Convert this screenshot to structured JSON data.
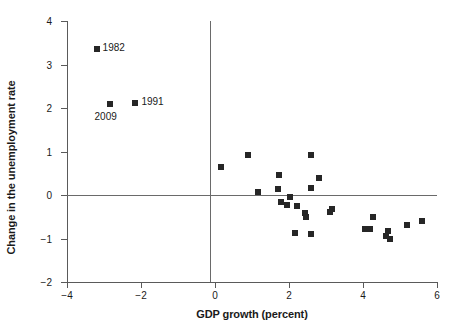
{
  "chart_data": {
    "type": "scatter",
    "title": "",
    "xlabel": "GDP growth (percent)",
    "ylabel": "Change in the unemployment rate",
    "xlim": [
      -4,
      6
    ],
    "ylim": [
      -2,
      4
    ],
    "xticks": [
      -4,
      -2,
      0,
      2,
      4,
      6
    ],
    "yticks": [
      -2,
      -1,
      0,
      1,
      2,
      3,
      4
    ],
    "xticklabels": [
      "−4",
      "−2",
      "0",
      "2",
      "4",
      "6"
    ],
    "yticklabels": [
      "−2",
      "−1",
      "0",
      "1",
      "2",
      "3",
      "4"
    ],
    "grid": false,
    "legend": "none",
    "zero_lines": {
      "horizontal": 0,
      "vertical": 0
    },
    "marker": {
      "shape": "square",
      "color": "#262626",
      "size_px": 6
    },
    "points": [
      {
        "x": -3.2,
        "y": 3.35,
        "label": "1982",
        "label_position": "right"
      },
      {
        "x": -2.85,
        "y": 2.1,
        "label": "2009",
        "label_position": "below"
      },
      {
        "x": -2.15,
        "y": 2.12,
        "label": "1991",
        "label_position": "right"
      },
      {
        "x": 0.15,
        "y": 0.65,
        "label": ""
      },
      {
        "x": 0.9,
        "y": 0.92,
        "label": ""
      },
      {
        "x": 1.15,
        "y": 0.07,
        "label": ""
      },
      {
        "x": 1.72,
        "y": 0.45,
        "label": ""
      },
      {
        "x": 1.7,
        "y": 0.14,
        "label": ""
      },
      {
        "x": 1.78,
        "y": -0.17,
        "label": ""
      },
      {
        "x": 1.95,
        "y": -0.22,
        "label": ""
      },
      {
        "x": 2.02,
        "y": -0.05,
        "label": ""
      },
      {
        "x": 2.15,
        "y": -0.88,
        "label": ""
      },
      {
        "x": 2.22,
        "y": -0.25,
        "label": ""
      },
      {
        "x": 2.42,
        "y": -0.42,
        "label": ""
      },
      {
        "x": 2.45,
        "y": -0.5,
        "label": ""
      },
      {
        "x": 2.6,
        "y": 0.92,
        "label": ""
      },
      {
        "x": 2.6,
        "y": 0.17,
        "label": ""
      },
      {
        "x": 2.6,
        "y": -0.9,
        "label": ""
      },
      {
        "x": 2.82,
        "y": 0.4,
        "label": ""
      },
      {
        "x": 3.1,
        "y": -0.38,
        "label": ""
      },
      {
        "x": 3.15,
        "y": -0.32,
        "label": ""
      },
      {
        "x": 4.05,
        "y": -0.78,
        "label": ""
      },
      {
        "x": 4.18,
        "y": -0.78,
        "label": ""
      },
      {
        "x": 4.28,
        "y": -0.5,
        "label": ""
      },
      {
        "x": 4.62,
        "y": -0.95,
        "label": ""
      },
      {
        "x": 4.68,
        "y": -0.82,
        "label": ""
      },
      {
        "x": 4.72,
        "y": -1.0,
        "label": ""
      },
      {
        "x": 5.18,
        "y": -0.7,
        "label": ""
      },
      {
        "x": 5.6,
        "y": -0.6,
        "label": ""
      }
    ]
  }
}
